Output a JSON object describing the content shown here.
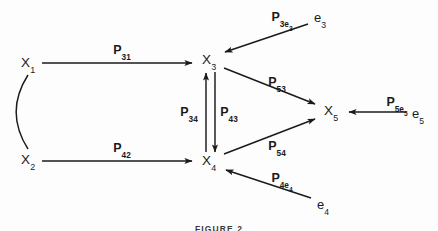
{
  "figure": {
    "caption": "FIGURE 2",
    "caption_top": 224,
    "background_color": "#fdfdfd",
    "ink_color": "#1a1a1a"
  },
  "nodes": [
    {
      "id": "x1",
      "name": "node-x1",
      "base": "X",
      "sub": "1",
      "x": 28,
      "y": 63
    },
    {
      "id": "x2",
      "name": "node-x2",
      "base": "X",
      "sub": "2",
      "x": 28,
      "y": 160
    },
    {
      "id": "x3",
      "name": "node-x3",
      "base": "X",
      "sub": "3",
      "x": 209,
      "y": 60
    },
    {
      "id": "x4",
      "name": "node-x4",
      "base": "X",
      "sub": "4",
      "x": 209,
      "y": 161
    },
    {
      "id": "x5",
      "name": "node-x5",
      "base": "X",
      "sub": "5",
      "x": 331,
      "y": 111
    }
  ],
  "errors": [
    {
      "id": "e3",
      "name": "error-term-e3",
      "base": "e",
      "sub": "3",
      "x": 320,
      "y": 17
    },
    {
      "id": "e5",
      "name": "error-term-e5",
      "base": "e",
      "sub": "5",
      "x": 418,
      "y": 113
    },
    {
      "id": "e4",
      "name": "error-term-e4",
      "base": "e",
      "sub": "4",
      "x": 323,
      "y": 204
    }
  ],
  "path_labels": [
    {
      "id": "p31",
      "name": "path-label-p31",
      "base": "P",
      "sub": "31",
      "x": 122,
      "y": 50
    },
    {
      "id": "p42",
      "name": "path-label-p42",
      "base": "P",
      "sub": "42",
      "x": 122,
      "y": 148
    },
    {
      "id": "p34",
      "name": "path-label-p34",
      "base": "P",
      "sub": "34",
      "x": 189,
      "y": 112
    },
    {
      "id": "p43",
      "name": "path-label-p43",
      "base": "P",
      "sub": "43",
      "x": 229,
      "y": 112
    },
    {
      "id": "p53",
      "name": "path-label-p53",
      "base": "P",
      "sub": "53",
      "x": 277,
      "y": 82
    },
    {
      "id": "p54",
      "name": "path-label-p54",
      "base": "P",
      "sub": "54",
      "x": 277,
      "y": 146
    },
    {
      "id": "p3e3",
      "name": "path-label-p3e3",
      "base": "P",
      "sub": "3e",
      "sub2": "3",
      "x": 282,
      "y": 18
    },
    {
      "id": "p5e5",
      "name": "path-label-p5e5",
      "base": "P",
      "sub": "5e",
      "sub2": "5",
      "x": 397,
      "y": 103
    },
    {
      "id": "p4e4",
      "name": "path-label-p4e4",
      "base": "P",
      "sub": "4e",
      "sub2": "4",
      "x": 282,
      "y": 179
    }
  ],
  "edges": [
    {
      "id": "x1-to-x3",
      "name": "arrow-x1-to-x3",
      "type": "directed",
      "from": "x1",
      "to": "x3",
      "label": "p31"
    },
    {
      "id": "x2-to-x4",
      "name": "arrow-x2-to-x4",
      "type": "directed",
      "from": "x2",
      "to": "x4",
      "label": "p42"
    },
    {
      "id": "x4-to-x3",
      "name": "arrow-x4-to-x3",
      "type": "directed",
      "from": "x4",
      "to": "x3",
      "label": "p34"
    },
    {
      "id": "x3-to-x4",
      "name": "arrow-x3-to-x4",
      "type": "directed",
      "from": "x3",
      "to": "x4",
      "label": "p43"
    },
    {
      "id": "x3-to-x5",
      "name": "arrow-x3-to-x5",
      "type": "directed",
      "from": "x3",
      "to": "x5",
      "label": "p53"
    },
    {
      "id": "x4-to-x5",
      "name": "arrow-x4-to-x5",
      "type": "directed",
      "from": "x4",
      "to": "x5",
      "label": "p54"
    },
    {
      "id": "e3-to-x3",
      "name": "arrow-e3-to-x3",
      "type": "directed",
      "from": "e3",
      "to": "x3",
      "label": "p3e3"
    },
    {
      "id": "e5-to-x5",
      "name": "arrow-e5-to-x5",
      "type": "directed",
      "from": "e5",
      "to": "x5",
      "label": "p5e5"
    },
    {
      "id": "e4-to-x4",
      "name": "arrow-e4-to-x4",
      "type": "directed",
      "from": "e4",
      "to": "x4",
      "label": "p4e4"
    },
    {
      "id": "x1-x2-cov",
      "name": "curve-x1-x2-correlation",
      "type": "curved-correlation",
      "from": "x1",
      "to": "x2",
      "label": ""
    }
  ]
}
